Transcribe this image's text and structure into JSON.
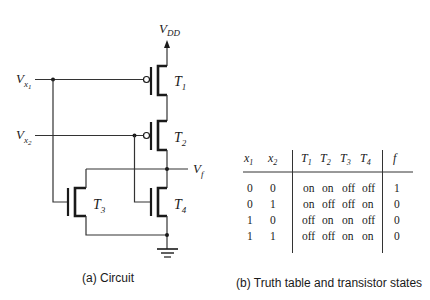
{
  "circuit": {
    "supply_label": "V",
    "supply_sub": "DD",
    "input1_label": "V",
    "input1_sub": "x",
    "input1_subsub": "1",
    "input2_label": "V",
    "input2_sub": "x",
    "input2_subsub": "2",
    "output_label": "V",
    "output_sub": "f",
    "transistors": [
      {
        "name": "T",
        "sub": "1",
        "type": "pmos"
      },
      {
        "name": "T",
        "sub": "2",
        "type": "pmos"
      },
      {
        "name": "T",
        "sub": "3",
        "type": "nmos"
      },
      {
        "name": "T",
        "sub": "4",
        "type": "nmos"
      }
    ],
    "caption": "(a) Circuit"
  },
  "table": {
    "headers": [
      {
        "base": "x",
        "sub": "1"
      },
      {
        "base": "x",
        "sub": "2"
      },
      {
        "base": "T",
        "sub": "1"
      },
      {
        "base": "T",
        "sub": "2"
      },
      {
        "base": "T",
        "sub": "3"
      },
      {
        "base": "T",
        "sub": "4"
      },
      {
        "base": "f",
        "sub": ""
      }
    ],
    "rows": [
      [
        "0",
        "0",
        "on",
        "on",
        "off",
        "off",
        "1"
      ],
      [
        "0",
        "1",
        "on",
        "off",
        "off",
        "on",
        "0"
      ],
      [
        "1",
        "0",
        "off",
        "on",
        "on",
        "off",
        "0"
      ],
      [
        "1",
        "1",
        "off",
        "off",
        "on",
        "on",
        "0"
      ]
    ],
    "caption": "(b) Truth table and transistor states"
  }
}
